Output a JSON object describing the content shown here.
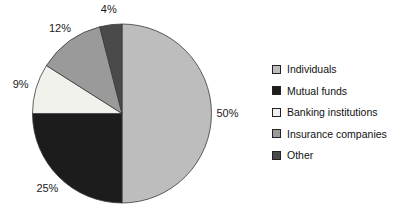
{
  "chart_data": {
    "type": "pie",
    "title": "",
    "categories": [
      "Individuals",
      "Mutual funds",
      "Banking institutions",
      "Insurance companies",
      "Other"
    ],
    "values": [
      50,
      25,
      9,
      12,
      4
    ],
    "percent_labels": [
      "50%",
      "25%",
      "9%",
      "12%",
      "4%"
    ],
    "colors": [
      "#bdbdbd",
      "#1c1c1c",
      "#f1f1ec",
      "#9a9a9a",
      "#4a4a4a"
    ],
    "stroke_color": "#3a3a3a",
    "start_angle_deg": 0,
    "direction": "clockwise",
    "legend_position": "right",
    "background": "#ffffff"
  },
  "legend": {
    "items": [
      {
        "label": "Individuals"
      },
      {
        "label": "Mutual funds"
      },
      {
        "label": "Banking institutions"
      },
      {
        "label": "Insurance companies"
      },
      {
        "label": "Other"
      }
    ]
  }
}
